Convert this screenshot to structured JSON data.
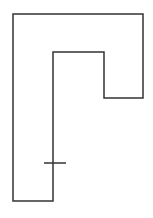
{
  "diagram": {
    "type": "polygon-outline",
    "stroke_color": "#333333",
    "background": "#ffffff",
    "outline_points": [
      [
        13,
        14
      ],
      [
        143,
        14
      ],
      [
        143,
        98
      ],
      [
        104,
        98
      ],
      [
        104,
        52
      ],
      [
        53,
        52
      ],
      [
        53,
        201
      ],
      [
        13,
        201
      ]
    ],
    "tick_mark": {
      "x1": 44,
      "y1": 163,
      "x2": 66,
      "y2": 163
    }
  }
}
